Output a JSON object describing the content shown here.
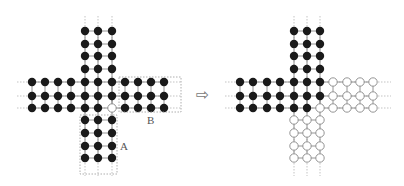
{
  "figure": {
    "left_panel": {
      "cols_top": [
        85,
        98,
        112
      ],
      "rows_top": [
        31,
        44,
        56,
        69
      ],
      "rows_mid": [
        82,
        96,
        108
      ],
      "cols_mid": [
        32,
        45,
        58,
        71,
        85,
        98,
        112,
        125,
        138,
        151,
        164
      ],
      "rows_bottom": [
        120,
        133,
        146,
        158
      ],
      "open_nodes": [
        [
          112,
          108
        ]
      ],
      "box_a": {
        "x": 80,
        "y": 115,
        "w": 37,
        "h": 59,
        "label": "A",
        "label_x": 120,
        "label_y": 140
      },
      "box_b": {
        "x": 119,
        "y": 77,
        "w": 62,
        "h": 35,
        "label": "B",
        "label_x": 147,
        "label_y": 114
      }
    },
    "arrow": {
      "x": 196,
      "y": 91,
      "symbol": "⇨"
    },
    "right_panel": {
      "cols_top": [
        294,
        307,
        320
      ],
      "rows_top": [
        31,
        44,
        56,
        69
      ],
      "rows_mid": [
        82,
        96,
        108
      ],
      "cols_mid": [
        240,
        253,
        267,
        280,
        294,
        307,
        320,
        333,
        347,
        360,
        373
      ],
      "rows_bottom": [
        120,
        133,
        146,
        158
      ],
      "filled_mid": {
        "82": 7,
        "96": 7,
        "108": 6
      },
      "bottom_filled": false
    },
    "colors": {
      "filled": "#1a1a1a",
      "open_stroke": "#888888",
      "edge": "#888888",
      "guide": "#aaaaaa",
      "box": "#999999"
    }
  }
}
